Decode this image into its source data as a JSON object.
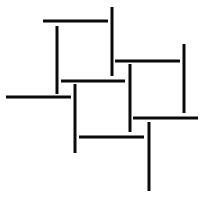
{
  "diagram": {
    "width": 209,
    "height": 203,
    "background": "#ffffff",
    "stroke_color": "#0a0a0a",
    "stroke_width": 3,
    "segments": [
      {
        "id": "h-top-left",
        "x1": 43,
        "y1": 21,
        "x2": 108,
        "y2": 21
      },
      {
        "id": "v-top-right",
        "x1": 112,
        "y1": 7,
        "x2": 112,
        "y2": 76
      },
      {
        "id": "v-upper-left",
        "x1": 57,
        "y1": 26,
        "x2": 57,
        "y2": 94
      },
      {
        "id": "h-upper-mid",
        "x1": 61,
        "y1": 81,
        "x2": 125,
        "y2": 81
      },
      {
        "id": "h-right-top",
        "x1": 115,
        "y1": 61,
        "x2": 180,
        "y2": 61
      },
      {
        "id": "v-far-right",
        "x1": 184,
        "y1": 44,
        "x2": 184,
        "y2": 113
      },
      {
        "id": "v-center-right",
        "x1": 130,
        "y1": 64,
        "x2": 130,
        "y2": 132
      },
      {
        "id": "h-right-bottom",
        "x1": 133,
        "y1": 118,
        "x2": 198,
        "y2": 118
      },
      {
        "id": "h-far-left",
        "x1": 6,
        "y1": 97,
        "x2": 71,
        "y2": 97
      },
      {
        "id": "v-center-left",
        "x1": 75,
        "y1": 84,
        "x2": 75,
        "y2": 153
      },
      {
        "id": "h-lower-mid",
        "x1": 79,
        "y1": 137,
        "x2": 144,
        "y2": 137
      },
      {
        "id": "v-bottom",
        "x1": 149,
        "y1": 122,
        "x2": 149,
        "y2": 191
      }
    ]
  }
}
